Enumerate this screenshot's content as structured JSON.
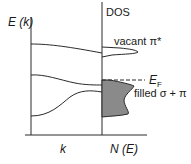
{
  "diagram": {
    "type": "band-structure-and-density-of-states",
    "left_panel": {
      "y_axis_label": "E (k)",
      "x_axis_label": "k",
      "bands": [
        {
          "name": "upper-band",
          "description": "flat band slightly decreasing to the right"
        },
        {
          "name": "middle-band",
          "description": "band decreasing toward Fermi level"
        },
        {
          "name": "lower-band",
          "description": "band rising toward Fermi level"
        }
      ]
    },
    "right_panel": {
      "title": "DOS",
      "x_axis_label": "N (E)",
      "features": [
        {
          "name": "vacant-pi-star",
          "label": "vacant π*",
          "filled": false
        },
        {
          "name": "filled-sigma-pi",
          "label": "filled σ + π",
          "filled": true,
          "fill_color": "#8a8a8a"
        }
      ],
      "fermi_level": {
        "label_main": "E",
        "label_sub": "F",
        "style": "dashed"
      }
    },
    "colors": {
      "line": "#2a2a2a",
      "fill": "#8a8a8a",
      "background": "#ffffff"
    }
  }
}
